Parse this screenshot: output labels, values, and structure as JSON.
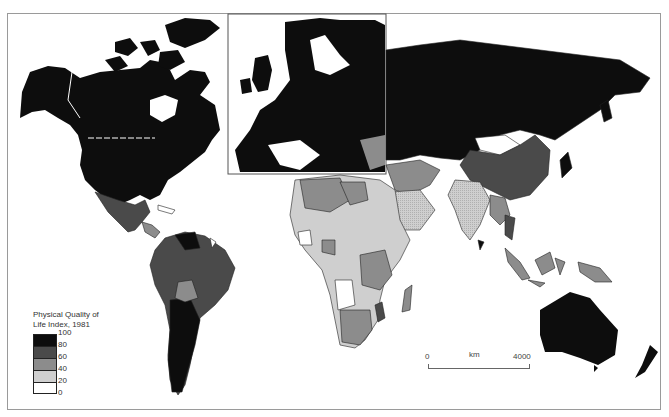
{
  "map": {
    "subject": "World map of Physical Quality of Life Index by country, 1981",
    "inset": "Europe (enlarged inset)"
  },
  "legend": {
    "title": "Physical Quality of Life Index, 1981",
    "title_line1": "Physical Quality of",
    "title_line2": "Life Index, 1981",
    "classes": [
      {
        "range": "80-100",
        "color": "#0d0d0d"
      },
      {
        "range": "60-80",
        "color": "#4a4a4a"
      },
      {
        "range": "40-60",
        "color": "#8c8c8c"
      },
      {
        "range": "20-40",
        "color": "#cfcfcf"
      },
      {
        "range": "0-20",
        "color": "#ffffff"
      }
    ],
    "ticks": [
      "100",
      "80",
      "60",
      "40",
      "20",
      "0"
    ]
  },
  "scale_bar": {
    "start": "0",
    "unit": "km",
    "end": "4000"
  },
  "colors": {
    "c100": "#0d0d0d",
    "c80": "#4a4a4a",
    "c60": "#8c8c8c",
    "c40": "#cfcfcf",
    "c20": "#ffffff",
    "border": "#222222"
  }
}
